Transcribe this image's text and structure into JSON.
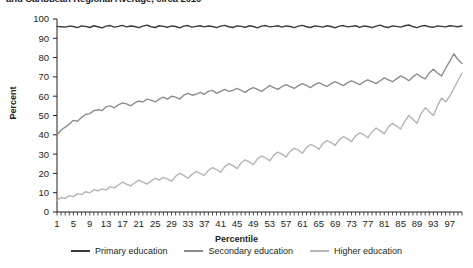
{
  "title": "and Caribbean Regional Average, circa 2010",
  "axes": {
    "y_title": "Percent",
    "x_title": "Percentile"
  },
  "legend": [
    {
      "label": "Primary education",
      "color": "#3a3a3a",
      "name": "primary-education"
    },
    {
      "label": "Secondary education",
      "color": "#8d8d8d",
      "name": "secondary-education"
    },
    {
      "label": "Higher education",
      "color": "#b4b4b4",
      "name": "higher-education"
    }
  ],
  "chart_data": {
    "type": "line",
    "title": "and Caribbean Regional Average, circa 2010",
    "xlabel": "Percentile",
    "ylabel": "Percent",
    "xlim": [
      1,
      100
    ],
    "ylim": [
      0,
      100
    ],
    "ytick_step": 10,
    "xtick_step": 4,
    "grid": false,
    "legend_position": "bottom",
    "yticks": [
      0,
      10,
      20,
      30,
      40,
      50,
      60,
      70,
      80,
      90,
      100
    ],
    "xticks": [
      1,
      5,
      9,
      13,
      17,
      21,
      25,
      29,
      33,
      37,
      41,
      45,
      49,
      53,
      57,
      61,
      65,
      69,
      73,
      77,
      81,
      85,
      89,
      93,
      97
    ],
    "x": [
      1,
      2,
      3,
      4,
      5,
      6,
      7,
      8,
      9,
      10,
      11,
      12,
      13,
      14,
      15,
      16,
      17,
      18,
      19,
      20,
      21,
      22,
      23,
      24,
      25,
      26,
      27,
      28,
      29,
      30,
      31,
      32,
      33,
      34,
      35,
      36,
      37,
      38,
      39,
      40,
      41,
      42,
      43,
      44,
      45,
      46,
      47,
      48,
      49,
      50,
      51,
      52,
      53,
      54,
      55,
      56,
      57,
      58,
      59,
      60,
      61,
      62,
      63,
      64,
      65,
      66,
      67,
      68,
      69,
      70,
      71,
      72,
      73,
      74,
      75,
      76,
      77,
      78,
      79,
      80,
      81,
      82,
      83,
      84,
      85,
      86,
      87,
      88,
      89,
      90,
      91,
      92,
      93,
      94,
      95,
      96,
      97,
      98,
      99,
      100
    ],
    "series": [
      {
        "name": "Primary education",
        "color": "#3a3a3a",
        "values": [
          96.2,
          96.0,
          95.8,
          96.3,
          96.1,
          95.5,
          96.4,
          96.2,
          95.6,
          96.5,
          96.0,
          95.4,
          96.3,
          96.6,
          95.8,
          96.2,
          96.7,
          95.9,
          96.4,
          96.1,
          95.5,
          96.3,
          96.8,
          96.0,
          95.6,
          96.5,
          96.2,
          95.7,
          96.4,
          96.1,
          95.4,
          96.3,
          96.6,
          95.8,
          96.2,
          96.5,
          95.9,
          96.4,
          96.1,
          95.5,
          96.3,
          96.7,
          96.0,
          95.6,
          96.4,
          96.2,
          95.7,
          96.5,
          96.1,
          95.4,
          96.3,
          96.6,
          95.9,
          96.2,
          96.5,
          95.8,
          96.4,
          96.1,
          95.5,
          96.3,
          96.7,
          96.0,
          95.6,
          96.4,
          96.2,
          95.8,
          96.5,
          96.1,
          95.4,
          96.3,
          96.6,
          95.9,
          96.2,
          96.5,
          95.7,
          96.4,
          96.1,
          95.5,
          96.3,
          96.8,
          96.0,
          95.6,
          96.4,
          96.2,
          95.8,
          96.5,
          96.9,
          96.1,
          95.5,
          96.3,
          96.6,
          96.0,
          95.7,
          96.4,
          96.2,
          95.9,
          96.5,
          96.3,
          96.0,
          96.4
        ]
      },
      {
        "name": "Secondary education",
        "color": "#8d8d8d",
        "values": [
          40.0,
          42.5,
          44.0,
          45.5,
          47.5,
          47.0,
          49.0,
          50.5,
          51.0,
          52.5,
          53.0,
          52.5,
          54.5,
          55.0,
          54.0,
          55.5,
          56.5,
          56.0,
          55.0,
          56.5,
          57.5,
          57.0,
          58.5,
          58.0,
          57.0,
          58.5,
          59.5,
          58.5,
          60.0,
          59.5,
          58.5,
          60.5,
          61.5,
          60.5,
          61.0,
          62.0,
          61.0,
          62.5,
          63.0,
          61.5,
          62.5,
          63.5,
          62.5,
          63.0,
          64.0,
          63.0,
          62.0,
          63.5,
          64.5,
          63.5,
          62.5,
          64.0,
          65.5,
          64.5,
          63.5,
          65.0,
          66.0,
          65.0,
          64.0,
          65.5,
          66.5,
          65.5,
          64.5,
          66.0,
          67.0,
          66.0,
          65.0,
          66.5,
          67.5,
          66.5,
          65.5,
          67.0,
          68.0,
          67.0,
          66.0,
          67.5,
          68.5,
          67.5,
          66.5,
          68.0,
          69.5,
          68.5,
          67.5,
          69.0,
          70.5,
          69.5,
          68.0,
          70.0,
          71.5,
          70.0,
          69.0,
          72.0,
          74.0,
          72.0,
          70.5,
          74.5,
          78.0,
          82.0,
          79.0,
          77.0
        ]
      },
      {
        "name": "Higher education",
        "color": "#b4b4b4",
        "values": [
          6.0,
          7.5,
          7.0,
          8.5,
          8.0,
          9.5,
          9.0,
          10.5,
          10.0,
          11.5,
          11.0,
          12.0,
          11.5,
          13.0,
          12.5,
          14.0,
          15.5,
          14.5,
          13.5,
          15.0,
          16.5,
          15.5,
          14.5,
          16.0,
          17.5,
          16.5,
          18.0,
          17.0,
          16.0,
          18.5,
          20.0,
          19.0,
          17.5,
          19.5,
          21.0,
          20.0,
          19.0,
          21.5,
          23.0,
          22.0,
          20.5,
          23.5,
          25.0,
          24.0,
          22.5,
          25.5,
          27.0,
          26.0,
          24.5,
          27.5,
          29.0,
          28.0,
          26.5,
          29.5,
          31.0,
          30.0,
          28.5,
          31.5,
          33.0,
          32.0,
          30.5,
          33.5,
          35.0,
          34.0,
          32.5,
          35.5,
          37.0,
          36.0,
          34.5,
          37.5,
          39.0,
          38.0,
          36.5,
          39.5,
          41.0,
          40.0,
          38.5,
          41.5,
          43.5,
          42.0,
          40.5,
          44.0,
          46.0,
          44.5,
          43.0,
          47.0,
          50.0,
          48.0,
          46.0,
          51.0,
          54.0,
          52.0,
          50.0,
          55.0,
          59.0,
          57.0,
          60.0,
          64.0,
          68.0,
          72.0
        ]
      }
    ]
  }
}
